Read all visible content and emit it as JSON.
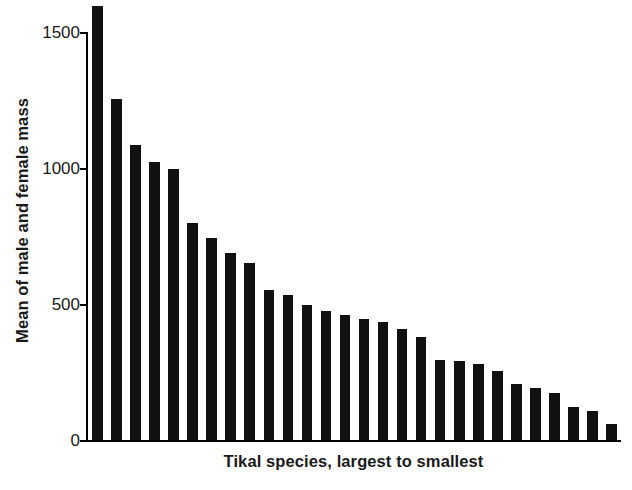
{
  "chart_data": {
    "type": "bar",
    "title": "",
    "subtitle": "",
    "xlabel": "Tikal species, largest to smallest",
    "ylabel": "Mean of male and female mass",
    "ylim": [
      0,
      1600
    ],
    "yticks": [
      0,
      500,
      1000,
      1500
    ],
    "ytick_labels": [
      "0",
      "500",
      "1000",
      "1500"
    ],
    "grid": false,
    "legend": null,
    "bar_color": "#111111",
    "categories": [
      "1",
      "2",
      "3",
      "4",
      "5",
      "6",
      "7",
      "8",
      "9",
      "10",
      "11",
      "12",
      "13",
      "14",
      "15",
      "16",
      "17",
      "18",
      "19",
      "20",
      "21",
      "22",
      "23",
      "24",
      "25",
      "26",
      "27",
      "28"
    ],
    "values": [
      1580,
      1240,
      1073,
      1012,
      985,
      790,
      735,
      680,
      645,
      545,
      528,
      490,
      468,
      455,
      440,
      430,
      405,
      375,
      290,
      288,
      275,
      252,
      205,
      190,
      172,
      120,
      105,
      60
    ],
    "n_bars": 28,
    "annotations": []
  },
  "axis": {
    "ytick_0": "0",
    "ytick_500": "500",
    "ytick_1000": "1000",
    "ytick_1500": "1500"
  }
}
